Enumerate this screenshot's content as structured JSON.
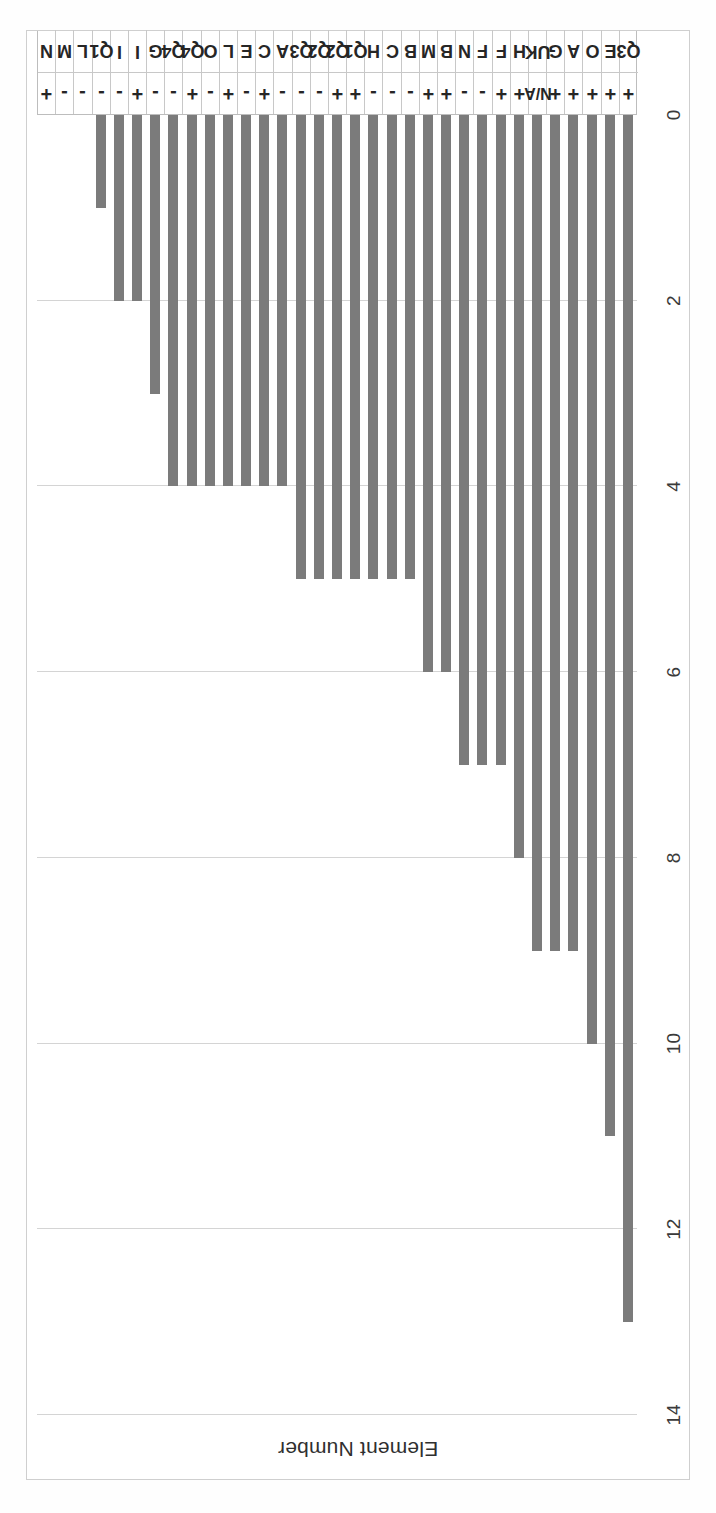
{
  "chart_data": {
    "type": "bar",
    "orientation": "horizontal",
    "title": "",
    "xlabel": "Element Number",
    "ylabel": "",
    "xlim": [
      0,
      14
    ],
    "xticks": [
      "0",
      "2",
      "4",
      "6",
      "8",
      "10",
      "12",
      "14"
    ],
    "xtick_values": [
      0,
      2,
      4,
      6,
      8,
      10,
      12,
      14
    ],
    "grid": true,
    "legend": "none",
    "bar_color": "#7b7b7b",
    "categories": [
      "N +",
      "M -",
      "L -",
      "Q1 -",
      "I -",
      "I +",
      "G -",
      "Q4 -",
      "Q4 +",
      "O -",
      "L +",
      "E -",
      "C +",
      "A -",
      "Q3 -",
      "Q2 -",
      "Q2 +",
      "Q1 +",
      "H -",
      "C -",
      "B -",
      "M +",
      "B +",
      "N -",
      "F -",
      "F +",
      "H +",
      "UK N/A",
      "G +",
      "A +",
      "O +",
      "E +",
      "Q3 +"
    ],
    "rows": [
      {
        "code": "N",
        "sign": "+",
        "value": 0
      },
      {
        "code": "M",
        "sign": "-",
        "value": 0
      },
      {
        "code": "L",
        "sign": "-",
        "value": 0
      },
      {
        "code": "Q1",
        "sign": "-",
        "value": 1
      },
      {
        "code": "I",
        "sign": "-",
        "value": 2
      },
      {
        "code": "I",
        "sign": "+",
        "value": 2
      },
      {
        "code": "G",
        "sign": "-",
        "value": 3
      },
      {
        "code": "Q4",
        "sign": "-",
        "value": 4
      },
      {
        "code": "Q4",
        "sign": "+",
        "value": 4
      },
      {
        "code": "O",
        "sign": "-",
        "value": 4
      },
      {
        "code": "L",
        "sign": "+",
        "value": 4
      },
      {
        "code": "E",
        "sign": "-",
        "value": 4
      },
      {
        "code": "C",
        "sign": "+",
        "value": 4
      },
      {
        "code": "A",
        "sign": "-",
        "value": 4
      },
      {
        "code": "Q3",
        "sign": "-",
        "value": 5
      },
      {
        "code": "Q2",
        "sign": "-",
        "value": 5
      },
      {
        "code": "Q2",
        "sign": "+",
        "value": 5
      },
      {
        "code": "Q1",
        "sign": "+",
        "value": 5
      },
      {
        "code": "H",
        "sign": "-",
        "value": 5
      },
      {
        "code": "C",
        "sign": "-",
        "value": 5
      },
      {
        "code": "B",
        "sign": "-",
        "value": 5
      },
      {
        "code": "M",
        "sign": "+",
        "value": 6
      },
      {
        "code": "B",
        "sign": "+",
        "value": 6
      },
      {
        "code": "N",
        "sign": "-",
        "value": 7
      },
      {
        "code": "F",
        "sign": "-",
        "value": 7
      },
      {
        "code": "F",
        "sign": "+",
        "value": 7
      },
      {
        "code": "H",
        "sign": "+",
        "value": 8
      },
      {
        "code": "UK",
        "sign": "N/A",
        "value": 9
      },
      {
        "code": "G",
        "sign": "+",
        "value": 9
      },
      {
        "code": "A",
        "sign": "+",
        "value": 9
      },
      {
        "code": "O",
        "sign": "+",
        "value": 10
      },
      {
        "code": "E",
        "sign": "+",
        "value": 11
      },
      {
        "code": "Q3",
        "sign": "+",
        "value": 13
      }
    ],
    "values": [
      0,
      0,
      0,
      1,
      2,
      2,
      3,
      4,
      4,
      4,
      4,
      4,
      4,
      4,
      5,
      5,
      5,
      5,
      5,
      5,
      5,
      6,
      6,
      7,
      7,
      7,
      8,
      9,
      9,
      9,
      10,
      11,
      13
    ]
  }
}
